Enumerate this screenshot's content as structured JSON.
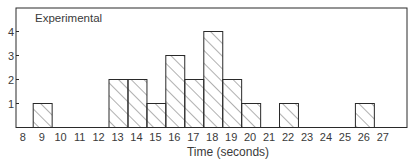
{
  "chart_data": {
    "type": "bar",
    "subtype": "histogram",
    "title": "",
    "annotation": "Experimental",
    "xlabel": "Time (seconds)",
    "ylabel": "",
    "categories": [
      "8",
      "9",
      "10",
      "11",
      "12",
      "13",
      "14",
      "15",
      "16",
      "17",
      "18",
      "19",
      "20",
      "21",
      "22",
      "23",
      "24",
      "25",
      "26",
      "27"
    ],
    "values": [
      0,
      1,
      0,
      0,
      0,
      2,
      2,
      1,
      3,
      2,
      4,
      2,
      1,
      0,
      1,
      0,
      0,
      0,
      1,
      0
    ],
    "yticks": [
      1,
      2,
      3,
      4
    ],
    "ylim": [
      0,
      4.8
    ],
    "xlim": [
      8,
      27
    ],
    "grid": false,
    "legend": null,
    "fill_pattern": "diagonal-hatch",
    "colors": {
      "stroke": "#2a2a2a",
      "hatch": "#3a3a3a",
      "background": "#ffffff"
    }
  }
}
